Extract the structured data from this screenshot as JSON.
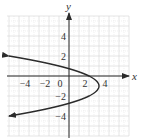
{
  "chart_data": {
    "type": "line",
    "title": "",
    "xlabel": "x",
    "ylabel": "y",
    "xlim": [
      -6,
      6
    ],
    "ylim": [
      -6,
      6
    ],
    "grid": true,
    "x_ticks": [
      {
        "value": -4,
        "label": "−4"
      },
      {
        "value": -2,
        "label": "−2"
      },
      {
        "value": 0,
        "label": "0"
      },
      {
        "value": 2,
        "label": "2"
      },
      {
        "value": 4,
        "label": "4"
      }
    ],
    "y_ticks": [
      {
        "value": 4,
        "label": "4"
      },
      {
        "value": 2,
        "label": "2"
      },
      {
        "value": -2,
        "label": "−2"
      },
      {
        "value": -4,
        "label": "−4"
      }
    ],
    "series": [
      {
        "name": "x = -(y+1)^2 + 3",
        "description": "Parabola opening left, vertex (3, -1), arrows at both ends",
        "vertex": [
          3,
          -1
        ],
        "y_intercepts": [
          0.73,
          -2.73
        ],
        "x": [
          -6,
          -3,
          0,
          2,
          3,
          2,
          0,
          -3,
          -6
        ],
        "y": [
          2,
          1.45,
          0.73,
          0,
          -1,
          -2,
          -2.73,
          -3.45,
          -4
        ],
        "end_arrows": true
      }
    ]
  },
  "colors": {
    "curve": "#2b2b2b",
    "axis": "#2b2b2b",
    "grid_major": "#d4d4d4",
    "grid_minor": "#e6e6e6",
    "text": "#333333"
  }
}
